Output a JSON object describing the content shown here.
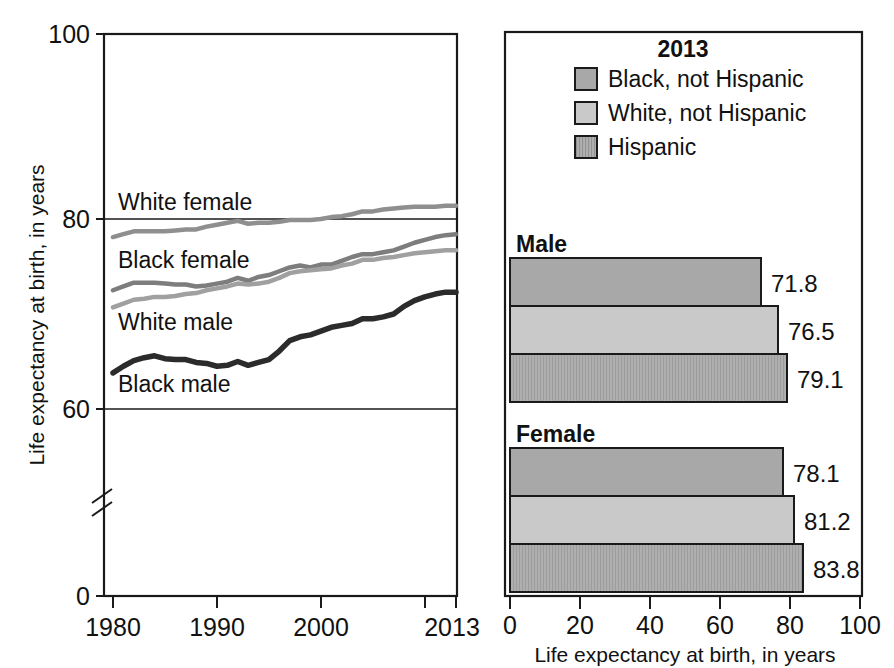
{
  "chart_data": [
    {
      "type": "line",
      "title": "",
      "xlabel": "",
      "ylabel": "Life expectancy at birth, in years",
      "xlim": [
        1980,
        2013
      ],
      "ylim": [
        0,
        100
      ],
      "y_axis_break": true,
      "y_ticks": [
        "0",
        "60",
        "80",
        "100"
      ],
      "x_ticks": [
        "1980",
        "1990",
        "2000",
        "2013"
      ],
      "x_minor_ticks": [
        "2010"
      ],
      "grid": true,
      "series": [
        {
          "name": "White female",
          "color": "#8f8f8f",
          "x": [
            1980,
            1981,
            1982,
            1983,
            1984,
            1985,
            1986,
            1987,
            1988,
            1989,
            1990,
            1991,
            1992,
            1993,
            1994,
            1995,
            1996,
            1997,
            1998,
            1999,
            2000,
            2001,
            2002,
            2003,
            2004,
            2005,
            2006,
            2007,
            2008,
            2009,
            2010,
            2011,
            2012,
            2013
          ],
          "values": [
            78.1,
            78.4,
            78.7,
            78.7,
            78.7,
            78.7,
            78.8,
            78.9,
            78.9,
            79.2,
            79.4,
            79.6,
            79.8,
            79.5,
            79.6,
            79.6,
            79.7,
            79.9,
            79.9,
            79.9,
            80.0,
            80.2,
            80.3,
            80.5,
            80.8,
            80.8,
            81.0,
            81.1,
            81.2,
            81.3,
            81.3,
            81.3,
            81.4,
            81.4
          ]
        },
        {
          "name": "Black female",
          "color": "#7d7d7d",
          "x": [
            1980,
            1981,
            1982,
            1983,
            1984,
            1985,
            1986,
            1987,
            1988,
            1989,
            1990,
            1991,
            1992,
            1993,
            1994,
            1995,
            1996,
            1997,
            1998,
            1999,
            2000,
            2001,
            2002,
            2003,
            2004,
            2005,
            2006,
            2007,
            2008,
            2009,
            2010,
            2011,
            2012,
            2013
          ],
          "values": [
            72.5,
            72.9,
            73.3,
            73.3,
            73.3,
            73.2,
            73.1,
            73.1,
            72.9,
            73.0,
            73.2,
            73.4,
            73.8,
            73.5,
            73.9,
            74.1,
            74.5,
            74.9,
            75.1,
            74.9,
            75.2,
            75.2,
            75.6,
            76.0,
            76.3,
            76.3,
            76.5,
            76.7,
            77.1,
            77.5,
            77.8,
            78.1,
            78.3,
            78.4
          ]
        },
        {
          "name": "White male",
          "color": "#a0a0a0",
          "x": [
            1980,
            1981,
            1982,
            1983,
            1984,
            1985,
            1986,
            1987,
            1988,
            1989,
            1990,
            1991,
            1992,
            1993,
            1994,
            1995,
            1996,
            1997,
            1998,
            1999,
            2000,
            2001,
            2002,
            2003,
            2004,
            2005,
            2006,
            2007,
            2008,
            2009,
            2010,
            2011,
            2012,
            2013
          ],
          "values": [
            70.7,
            71.1,
            71.5,
            71.6,
            71.8,
            71.8,
            71.9,
            72.1,
            72.2,
            72.5,
            72.7,
            72.9,
            73.2,
            73.1,
            73.2,
            73.4,
            73.8,
            74.3,
            74.5,
            74.6,
            74.7,
            74.8,
            75.1,
            75.3,
            75.7,
            75.7,
            75.9,
            76.0,
            76.2,
            76.4,
            76.5,
            76.6,
            76.7,
            76.7
          ]
        },
        {
          "name": "Black male",
          "color": "#2b2b2b",
          "x": [
            1980,
            1981,
            1982,
            1983,
            1984,
            1985,
            1986,
            1987,
            1988,
            1989,
            1990,
            1991,
            1992,
            1993,
            1994,
            1995,
            1996,
            1997,
            1998,
            1999,
            2000,
            2001,
            2002,
            2003,
            2004,
            2005,
            2006,
            2007,
            2008,
            2009,
            2010,
            2011,
            2012,
            2013
          ],
          "values": [
            63.8,
            64.5,
            65.1,
            65.4,
            65.6,
            65.3,
            65.2,
            65.2,
            64.9,
            64.8,
            64.5,
            64.6,
            65.0,
            64.6,
            64.9,
            65.2,
            66.1,
            67.2,
            67.6,
            67.8,
            68.2,
            68.6,
            68.8,
            69.0,
            69.5,
            69.5,
            69.7,
            70.0,
            70.8,
            71.4,
            71.8,
            72.1,
            72.3,
            72.3
          ]
        }
      ]
    },
    {
      "type": "bar",
      "orientation": "horizontal",
      "title": "2013",
      "xlabel": "Life expectancy at birth, in years",
      "ylabel": "",
      "xlim": [
        0,
        100
      ],
      "x_ticks": [
        "0",
        "20",
        "40",
        "60",
        "80",
        "100"
      ],
      "grid": false,
      "legend_position": "top",
      "categories": [
        "Male",
        "Female"
      ],
      "series": [
        {
          "name": "Black, not Hispanic",
          "color": "#a8a8a8",
          "pattern": "solid",
          "values": [
            71.8,
            78.1
          ],
          "labels": [
            "71.8",
            "78.1"
          ]
        },
        {
          "name": "White, not Hispanic",
          "color": "#c9c9c9",
          "pattern": "solid",
          "values": [
            76.5,
            81.2
          ],
          "labels": [
            "76.5",
            "81.2"
          ]
        },
        {
          "name": "Hispanic",
          "color": "#b0b0b0",
          "pattern": "vertical-hatch",
          "values": [
            79.1,
            83.8
          ],
          "labels": [
            "79.1",
            "83.8"
          ]
        }
      ]
    }
  ],
  "left_panel": {
    "y_axis_title": "Life expectancy at birth, in years",
    "y_ticks": [
      {
        "label": "100",
        "value": 100
      },
      {
        "label": "80",
        "value": 80
      },
      {
        "label": "60",
        "value": 60
      },
      {
        "label": "0",
        "value": 0
      }
    ],
    "x_ticks": [
      {
        "label": "1980",
        "value": 1980
      },
      {
        "label": "1990",
        "value": 1990
      },
      {
        "label": "2000",
        "value": 2000
      },
      {
        "label": "2013",
        "value": 2013
      }
    ],
    "series_labels": [
      {
        "text": "White female",
        "x": 118,
        "y": 210
      },
      {
        "text": "Black female",
        "x": 118,
        "y": 268
      },
      {
        "text": "White male",
        "x": 118,
        "y": 330
      },
      {
        "text": "Black male",
        "x": 118,
        "y": 392
      }
    ]
  },
  "right_panel": {
    "legend_title": "2013",
    "legend_items": [
      {
        "label": "Black, not Hispanic",
        "color": "#a8a8a8",
        "pattern": "solid"
      },
      {
        "label": "White, not Hispanic",
        "color": "#c9c9c9",
        "pattern": "solid"
      },
      {
        "label": "Hispanic",
        "color": "#b0b0b0",
        "pattern": "vertical-hatch"
      }
    ],
    "groups": [
      {
        "label": "Male",
        "bars": [
          {
            "series": "Black, not Hispanic",
            "value": 71.8,
            "label": "71.8",
            "color": "#a8a8a8",
            "pattern": "solid"
          },
          {
            "series": "White, not Hispanic",
            "value": 76.5,
            "label": "76.5",
            "color": "#c9c9c9",
            "pattern": "solid"
          },
          {
            "series": "Hispanic",
            "value": 79.1,
            "label": "79.1",
            "color": "#b0b0b0",
            "pattern": "vertical-hatch"
          }
        ]
      },
      {
        "label": "Female",
        "bars": [
          {
            "series": "Black, not Hispanic",
            "value": 78.1,
            "label": "78.1",
            "color": "#a8a8a8",
            "pattern": "solid"
          },
          {
            "series": "White, not Hispanic",
            "value": 81.2,
            "label": "81.2",
            "color": "#c9c9c9",
            "pattern": "solid"
          },
          {
            "series": "Hispanic",
            "value": 83.8,
            "label": "83.8",
            "color": "#b0b0b0",
            "pattern": "vertical-hatch"
          }
        ]
      }
    ],
    "x_axis_title": "Life expectancy at birth, in years",
    "x_ticks": [
      {
        "label": "0",
        "value": 0
      },
      {
        "label": "20",
        "value": 20
      },
      {
        "label": "40",
        "value": 40
      },
      {
        "label": "60",
        "value": 60
      },
      {
        "label": "80",
        "value": 80
      },
      {
        "label": "100",
        "value": 100
      }
    ]
  }
}
